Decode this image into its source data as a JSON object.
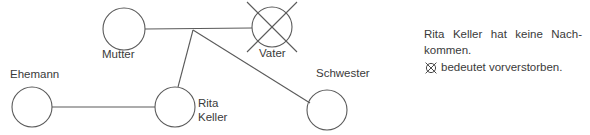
{
  "diagram": {
    "type": "genogram",
    "stroke_color": "#5a5a5a",
    "text_color": "#3a3a3a",
    "background": "#ffffff",
    "nodes": [
      {
        "id": "mutter",
        "label": "Mutter",
        "shape": "circle",
        "cx": 124,
        "cy": 29,
        "r": 21
      },
      {
        "id": "vater",
        "label": "Vater",
        "shape": "crossed-circle",
        "cx": 272,
        "cy": 27,
        "r": 20
      },
      {
        "id": "ehemann",
        "label": "Ehemann",
        "shape": "circle",
        "cx": 32,
        "cy": 107,
        "r": 20
      },
      {
        "id": "rita",
        "label": "Rita\nKeller",
        "shape": "circle",
        "cx": 175,
        "cy": 107,
        "r": 20
      },
      {
        "id": "schwester",
        "label": "Schwester",
        "shape": "circle",
        "cx": 327,
        "cy": 110,
        "r": 20
      }
    ],
    "labels": {
      "mutter": "Mutter",
      "vater": "Vater",
      "ehemann": "Ehemann",
      "rita_line1": "Rita",
      "rita_line2": "Keller",
      "schwester": "Schwester"
    },
    "edges": [
      {
        "id": "mutter-vater",
        "from": "mutter",
        "to": "vater",
        "kind": "partner-line"
      },
      {
        "id": "junction-rita",
        "from": "junction",
        "to": "rita",
        "kind": "descent-line"
      },
      {
        "id": "junction-schwester",
        "from": "junction",
        "to": "schwester",
        "kind": "descent-line"
      },
      {
        "id": "ehemann-rita",
        "from": "ehemann",
        "to": "rita",
        "kind": "partner-line"
      }
    ],
    "junction": {
      "x": 193,
      "y": 30
    }
  },
  "legend": {
    "note_line1": "Rita Keller hat keine Nach-",
    "note_line2": "kommen.",
    "symbol_name": "crossed-circle",
    "symbol_text": "bedeutet vorverstorben."
  }
}
